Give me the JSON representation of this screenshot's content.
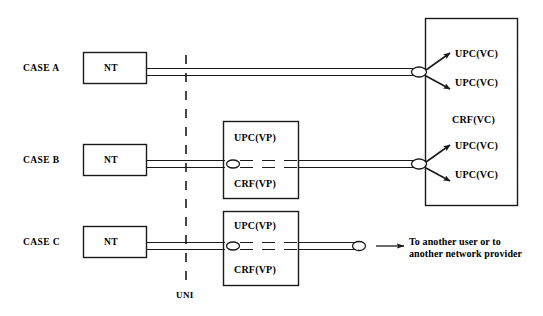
{
  "figure": {
    "background_color": "#ffffff",
    "line_color": "#1a1a1a",
    "text_color": "#000000"
  },
  "cases": [
    {
      "id": "case-a",
      "label": "CASE A",
      "nt_label": "NT",
      "has_vp_box": false,
      "endpoint": "crf-vc",
      "outputs": [
        "UPC(VC)",
        "UPC(VC)"
      ]
    },
    {
      "id": "case-b",
      "label": "CASE B",
      "nt_label": "NT",
      "has_vp_box": true,
      "vp_box_top_label": "UPC(VP)",
      "vp_box_bottom_label": "CRF(VP)",
      "endpoint": "crf-vc",
      "outputs": [
        "UPC(VC)",
        "UPC(VC)"
      ]
    },
    {
      "id": "case-c",
      "label": "CASE C",
      "nt_label": "NT",
      "has_vp_box": true,
      "vp_box_top_label": "UPC(VP)",
      "vp_box_bottom_label": "CRF(VP)",
      "endpoint": "external",
      "outputs": []
    }
  ],
  "crf_vc_box": {
    "label": "CRF(VC)",
    "upc_a_1": "UPC(VC)",
    "upc_a_2": "UPC(VC)",
    "upc_b_1": "UPC(VC)",
    "upc_b_2": "UPC(VC)"
  },
  "interface": {
    "uni_label": "UNI"
  },
  "external_note": {
    "line1": "To  another user or to",
    "line2": "another network provider"
  }
}
